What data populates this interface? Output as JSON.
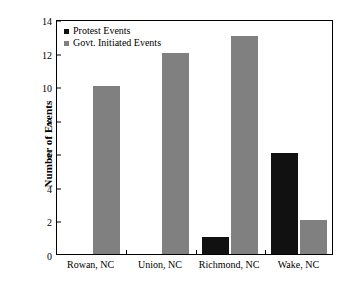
{
  "chart_data": {
    "type": "bar",
    "title": "",
    "subtitle": "",
    "xlabel": "",
    "ylabel": "Number of Events",
    "categories": [
      "Rowan, NC",
      "Union, NC",
      "Richmond, NC",
      "Wake, NC"
    ],
    "series": [
      {
        "name": "Protest Events",
        "color": "#111111",
        "values": [
          0,
          0,
          1,
          6
        ]
      },
      {
        "name": "Govt. Initiated Events",
        "color": "#808080",
        "values": [
          10,
          12,
          13,
          2
        ]
      }
    ],
    "ylim": [
      0,
      14
    ],
    "yticks": [
      0,
      2,
      4,
      6,
      8,
      10,
      12,
      14
    ],
    "ytick_labels": [
      "0",
      "2",
      "4",
      "6",
      "8",
      "10",
      "12",
      "14"
    ],
    "grid": false,
    "legend_position": "top-left-inside",
    "frame": "full-box",
    "tick_direction": "in"
  },
  "legend": {
    "entries": [
      {
        "label": "Protest Events",
        "swatch": "#111111"
      },
      {
        "label": "Govt. Initiated Events",
        "swatch": "#808080"
      }
    ]
  },
  "axes": {
    "y_title": "Number of Events"
  },
  "colors": {
    "protest": "#111111",
    "govt": "#808080",
    "axis": "#000000",
    "background": "#ffffff"
  }
}
